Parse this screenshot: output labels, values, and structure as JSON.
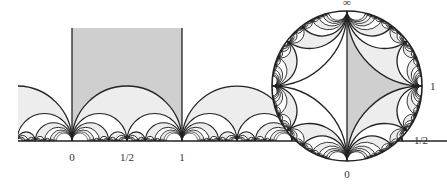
{
  "figure": {
    "colors": {
      "stroke": "#222222",
      "fundamental_fill": "#cfcfcf",
      "light_fill": "#ededed",
      "background": "#ffffff"
    },
    "half_plane": {
      "labels": [
        {
          "text": "0",
          "value": 0
        },
        {
          "text": "1/2",
          "value": 0.5
        },
        {
          "text": "1",
          "value": 1
        }
      ]
    },
    "disk": {
      "labels": [
        {
          "text": "∞",
          "position": "top"
        },
        {
          "text": "1",
          "position": "right"
        },
        {
          "text": "1/2",
          "position": "lower-right"
        },
        {
          "text": "0",
          "position": "bottom"
        }
      ]
    }
  }
}
